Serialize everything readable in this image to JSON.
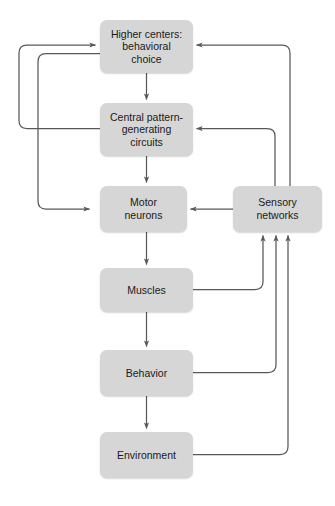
{
  "diagram": {
    "background_color": "#ffffff",
    "node_fill_color": "#d6d6d6",
    "edge_color": "#595959",
    "text_color": "#1a1a1a",
    "nodes": [
      {
        "id": "higher-centers",
        "label": "Higher centers:\nbehavioral\nchoice",
        "x": 100,
        "y": 20,
        "width": 93,
        "height": 53
      },
      {
        "id": "central-pattern-generating-circuits",
        "label": "Central pattern-\ngenerating\ncircuits",
        "x": 100,
        "y": 103,
        "width": 93,
        "height": 53
      },
      {
        "id": "motor-neurons",
        "label": "Motor\nneurons",
        "x": 100,
        "y": 186,
        "width": 87,
        "height": 46
      },
      {
        "id": "muscles",
        "label": "Muscles",
        "x": 100,
        "y": 268,
        "width": 93,
        "height": 44
      },
      {
        "id": "behavior",
        "label": "Behavior",
        "x": 100,
        "y": 350,
        "width": 93,
        "height": 46
      },
      {
        "id": "environment",
        "label": "Environment",
        "x": 100,
        "y": 432,
        "width": 93,
        "height": 46
      },
      {
        "id": "sensory-networks",
        "label": "Sensory\nnetworks",
        "x": 233,
        "y": 186,
        "width": 89,
        "height": 46
      }
    ],
    "edges": [
      {
        "id": "higher-to-cpg",
        "from": "higher-centers",
        "to": "central-pattern-generating-circuits",
        "arrow": true
      },
      {
        "id": "cpg-to-motor",
        "from": "central-pattern-generating-circuits",
        "to": "motor-neurons",
        "arrow": true
      },
      {
        "id": "motor-to-muscles",
        "from": "motor-neurons",
        "to": "muscles",
        "arrow": true
      },
      {
        "id": "muscles-to-behavior",
        "from": "muscles",
        "to": "behavior",
        "arrow": true
      },
      {
        "id": "behavior-to-environment",
        "from": "behavior",
        "to": "environment",
        "arrow": true
      },
      {
        "id": "cpg-to-higher-feedback",
        "from": "central-pattern-generating-circuits",
        "to": "higher-centers",
        "arrow": true
      },
      {
        "id": "higher-to-motor-feedforward",
        "from": "higher-centers",
        "to": "motor-neurons",
        "arrow": true
      },
      {
        "id": "muscles-to-sensory",
        "from": "muscles",
        "to": "sensory-networks",
        "arrow": true
      },
      {
        "id": "behavior-to-sensory",
        "from": "behavior",
        "to": "sensory-networks",
        "arrow": true
      },
      {
        "id": "environment-to-sensory",
        "from": "environment",
        "to": "sensory-networks",
        "arrow": true
      },
      {
        "id": "sensory-to-motor",
        "from": "sensory-networks",
        "to": "motor-neurons",
        "arrow": true
      },
      {
        "id": "sensory-to-cpg",
        "from": "sensory-networks",
        "to": "central-pattern-generating-circuits",
        "arrow": true
      },
      {
        "id": "sensory-to-higher",
        "from": "sensory-networks",
        "to": "higher-centers",
        "arrow": true
      }
    ]
  }
}
